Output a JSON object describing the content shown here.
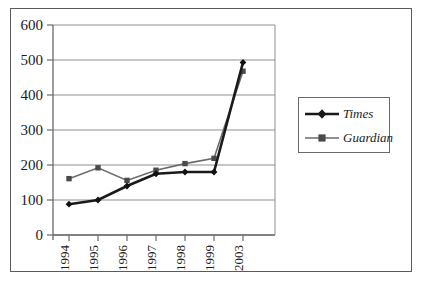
{
  "chart_data": {
    "type": "line",
    "title": "",
    "xlabel": "",
    "ylabel": "",
    "categories": [
      "1994",
      "1995",
      "1996",
      "1997",
      "1998",
      "1999",
      "2003"
    ],
    "ylim": [
      0,
      600
    ],
    "yticks": [
      0,
      100,
      200,
      300,
      400,
      500,
      600
    ],
    "grid": true,
    "legend_position": "right",
    "series": [
      {
        "name": "Times",
        "marker": "diamond",
        "color": "#1a1a1a",
        "values": [
          88,
          100,
          140,
          175,
          180,
          180,
          493
        ]
      },
      {
        "name": "Guardian",
        "marker": "square",
        "color": "#5f5f5f",
        "values": [
          161,
          192,
          156,
          185,
          204,
          219,
          468
        ]
      }
    ]
  },
  "axis": {
    "y_tick_labels": [
      "600",
      "500",
      "400",
      "300",
      "200",
      "100",
      "0"
    ],
    "x_tick_labels": [
      "1994",
      "1995",
      "1996",
      "1997",
      "1998",
      "1999",
      "2003"
    ]
  },
  "legend": {
    "entries": [
      {
        "label": "Times"
      },
      {
        "label": "Guardian"
      }
    ]
  },
  "colors": {
    "times_line": "#1a1a1a",
    "guardian_line": "#6b6b6b",
    "gridline": "#8f8f8f",
    "axis": "#6a6a6a",
    "frame": "#5a5a5a",
    "text": "#1c1c1c",
    "background": "#ffffff"
  }
}
